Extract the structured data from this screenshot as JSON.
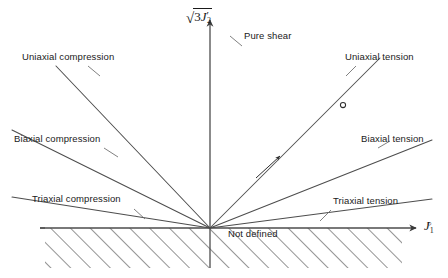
{
  "figure": {
    "background_color": "#ffffff",
    "line_color": "#4d4d4d",
    "axis_color": "#4d4d4d",
    "text_color": "#1a1a1a",
    "width": 448,
    "height": 278
  },
  "axes": {
    "origin": {
      "x": 210,
      "y": 228
    },
    "vertical": {
      "name": "sqrt(3J2prime)",
      "radical": "√",
      "number": "3",
      "symbol": "J",
      "prime": "′",
      "subscript": "2",
      "top_y": 18,
      "bottom_y": 268
    },
    "horizontal": {
      "name": "J1o",
      "symbol": "J",
      "subscript": "1",
      "superscript": "○",
      "left_x": 6,
      "right_x": 418
    }
  },
  "rays": [
    {
      "id": "uniaxial-compression",
      "label": "Uniaxial compression",
      "side": "left",
      "end_x": 56,
      "end_y": 66
    },
    {
      "id": "biaxial-compression",
      "label": "Biaxial compression",
      "side": "left",
      "end_x": 12,
      "end_y": 130
    },
    {
      "id": "triaxial-compression",
      "label": "Triaxial compression",
      "side": "left",
      "end_x": 12,
      "end_y": 197
    },
    {
      "id": "pure-shear",
      "label": "Pure shear",
      "side": "axis",
      "end_x": 210,
      "end_y": 18
    },
    {
      "id": "uniaxial-tension",
      "label": "Uniaxial tension",
      "side": "right",
      "end_x": 380,
      "end_y": 58
    },
    {
      "id": "biaxial-tension",
      "label": "Biaxial tension",
      "side": "right",
      "end_x": 432,
      "end_y": 140
    },
    {
      "id": "triaxial-tension",
      "label": "Triaxial tension",
      "side": "right",
      "end_x": 432,
      "end_y": 199
    }
  ],
  "annotations": {
    "not_defined": "Not defined",
    "hatched_region": {
      "x_start": 45,
      "x_end": 402,
      "y_top": 228,
      "y_bottom": 268,
      "pattern": "diagonal-hatch-up-right"
    },
    "direction_arrow": {
      "on_ray": "uniaxial-tension",
      "x": 270,
      "y": 166
    },
    "point_marker": {
      "on_ray": "uniaxial-tension",
      "glyph": "circle",
      "x": 343,
      "y": 105
    }
  },
  "labels": {
    "uniaxial_compression": "Uniaxial compression",
    "biaxial_compression": "Biaxial compression",
    "triaxial_compression": "Triaxial compression",
    "pure_shear": "Pure shear",
    "uniaxial_tension": "Uniaxial tension",
    "biaxial_tension": "Biaxial tension",
    "triaxial_tension": "Triaxial tension",
    "not_defined": "Not defined"
  }
}
